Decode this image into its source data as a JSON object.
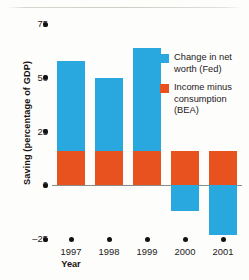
{
  "chart_data": {
    "type": "bar",
    "title": "",
    "subtitle": "",
    "xlabel": "Year",
    "ylabel": "Saving (percentage of GDP)",
    "categories": [
      "1997",
      "1998",
      "1999",
      "2000",
      "2001"
    ],
    "ylim": [
      -25,
      75
    ],
    "yticks": [
      75,
      50,
      25,
      0,
      -25
    ],
    "ytick_labels": [
      "75",
      "50",
      "25",
      "0",
      "–25"
    ],
    "grid": false,
    "stacked": true,
    "legend_position": "right",
    "series": [
      {
        "name": "Income minus consumption (BEA)",
        "color": "#e8521e",
        "values": [
          16,
          16,
          16,
          16,
          16
        ]
      },
      {
        "name": "Change in net worth (Fed)",
        "color": "#29a8e0",
        "values": [
          42,
          34,
          48,
          -12,
          -23
        ],
        "note": "segment above the BEA orange portion; negative values drawn below zero"
      }
    ],
    "bar_totals": [
      58,
      50,
      64,
      -12,
      -23
    ],
    "annotations": []
  },
  "legend": {
    "items": [
      {
        "label": "Change in net worth (Fed)",
        "color": "#29a8e0"
      },
      {
        "label": "Income minus consumption (BEA)",
        "color": "#e8521e"
      }
    ]
  },
  "axes": {
    "y_title": "Saving (percentage of GDP)",
    "x_title": "Year",
    "y_tick_labels": [
      "75",
      "50",
      "25",
      "0",
      "–25"
    ],
    "x_tick_labels": [
      "1997",
      "1998",
      "1999",
      "2000",
      "2001"
    ]
  },
  "colors": {
    "blue": "#29a8e0",
    "orange": "#e8521e",
    "axis": "#8d8b86",
    "text": "#24201c",
    "background": "#fdfdfb"
  }
}
